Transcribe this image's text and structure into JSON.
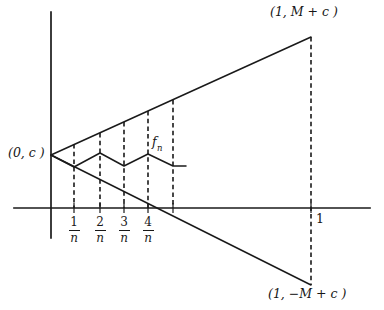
{
  "figure": {
    "background_color": "#ffffff",
    "stroke_color": "#1a1a1a"
  },
  "labels": {
    "top_right": "(1, M + c )",
    "bottom_right": "(1, −M + c )",
    "origin": "(0, c )",
    "function_name": "f",
    "function_subscript": "n",
    "x_tick_one": "1"
  },
  "axes": {
    "x_axis": {
      "y": 208,
      "x_start": 14,
      "x_end": 370
    },
    "y_axis": {
      "x": 51,
      "y_start": 12,
      "y_end": 238
    }
  },
  "x_ticks": [
    {
      "label_num": "1",
      "label_den": "n",
      "x": 74
    },
    {
      "label_num": "2",
      "label_den": "n",
      "x": 100
    },
    {
      "label_num": "3",
      "label_den": "n",
      "x": 124
    },
    {
      "label_num": "4",
      "label_den": "n",
      "x": 148
    }
  ],
  "chart_data": {
    "type": "line",
    "xlabel": "",
    "ylabel": "",
    "envelope_upper": {
      "name": "upper envelope",
      "points": [
        [
          51,
          155
        ],
        [
          311,
          37
        ]
      ]
    },
    "envelope_lower": {
      "name": "lower envelope",
      "points": [
        [
          51,
          155
        ],
        [
          311,
          285
        ]
      ]
    },
    "zigzag": {
      "name": "f_n",
      "points": [
        [
          51,
          155
        ],
        [
          74,
          167
        ],
        [
          100,
          153
        ],
        [
          124,
          166
        ],
        [
          148,
          154
        ],
        [
          173,
          166
        ],
        [
          186,
          166
        ]
      ]
    },
    "dashed_verticals": [
      {
        "x": 74,
        "y_top": 144,
        "y_bottom": 208
      },
      {
        "x": 100,
        "y_top": 133,
        "y_bottom": 208
      },
      {
        "x": 124,
        "y_top": 122,
        "y_bottom": 208
      },
      {
        "x": 148,
        "y_top": 111,
        "y_bottom": 208
      },
      {
        "x": 173,
        "y_top": 100,
        "y_bottom": 208
      },
      {
        "x": 311,
        "y_top": 37,
        "y_bottom": 285
      }
    ],
    "axis_tick_marks": [
      74,
      100,
      124,
      148,
      173,
      311
    ]
  }
}
